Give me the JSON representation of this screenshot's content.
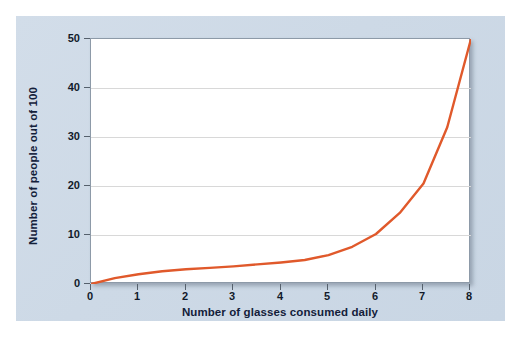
{
  "chart_data": {
    "type": "line",
    "title": "",
    "subtitle": "",
    "xlabel": "Number of glasses consumed daily",
    "ylabel": "Number of people out of 100",
    "xlim": [
      0,
      8
    ],
    "ylim": [
      0,
      50
    ],
    "xticks": [
      "0",
      "1",
      "2",
      "3",
      "4",
      "5",
      "6",
      "7",
      "8"
    ],
    "yticks": [
      "0",
      "10",
      "20",
      "30",
      "40",
      "50"
    ],
    "gridlines_y": [
      10,
      20,
      30,
      40
    ],
    "grid": "horizontal-only",
    "legend": "none",
    "series": [
      {
        "name": "Number of people out of 100",
        "color": "#e0592b",
        "x": [
          0,
          0.5,
          1,
          1.5,
          2,
          2.5,
          3,
          3.5,
          4,
          4.5,
          5,
          5.5,
          6,
          6.5,
          7,
          7.5,
          8
        ],
        "values": [
          0,
          1.2,
          2.0,
          2.6,
          3.0,
          3.3,
          3.6,
          4.0,
          4.4,
          4.9,
          5.9,
          7.6,
          10.2,
          14.5,
          20.5,
          32.0,
          50.0
        ]
      }
    ],
    "key_points": {
      "x": [
        0,
        1,
        2,
        3,
        4,
        5,
        6,
        7,
        8
      ],
      "values": [
        0,
        2,
        3,
        3.6,
        4.4,
        5.9,
        10.2,
        20.5,
        50
      ]
    },
    "annotations": []
  },
  "colors": {
    "series_line": "#e0592b",
    "panel_background": "#cdd9e6",
    "plot_background": "#ffffff",
    "plot_border": "#8d9aa8",
    "gridline": "#d8d8d8",
    "axis_text": "#13203a",
    "tick_mark": "#55606c"
  }
}
